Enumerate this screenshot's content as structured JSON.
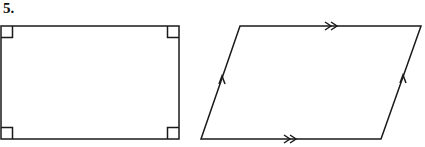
{
  "problem": {
    "number": "5."
  },
  "figures": [
    {
      "name": "rectangle",
      "marks": "right-angle markers at all four corners",
      "points": [
        [
          1,
          26
        ],
        [
          179,
          26
        ],
        [
          179,
          139
        ],
        [
          1,
          139
        ]
      ]
    },
    {
      "name": "parallelogram",
      "marks": "double arrows on top and bottom sides, single arrows on left and right sides",
      "points": [
        [
          240,
          26
        ],
        [
          421,
          26
        ],
        [
          381,
          139
        ],
        [
          201,
          139
        ]
      ]
    }
  ],
  "colors": {
    "stroke": "#1a1a1a",
    "background": "#ffffff"
  }
}
